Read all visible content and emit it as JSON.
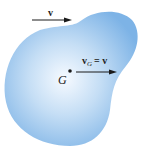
{
  "diagram": {
    "body_color": "#7fb6e8",
    "body_highlight": "#f4f9ff",
    "arrow_color": "#1a1a1a",
    "labels": {
      "top_velocity": "v",
      "center_velocity_main": "v",
      "center_velocity_sub": "G",
      "center_velocity_eq": "= v",
      "center_of_mass": "G"
    }
  }
}
